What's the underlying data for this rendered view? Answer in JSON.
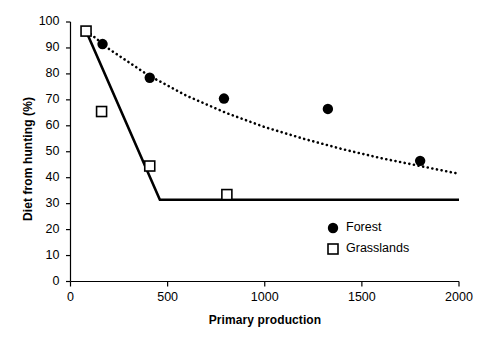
{
  "chart_data": {
    "type": "scatter",
    "title": "",
    "xlabel": "Primary production",
    "ylabel": "Diet from hunting (%)",
    "xlim": [
      0,
      2000
    ],
    "ylim": [
      0,
      100
    ],
    "xticks": [
      0,
      500,
      1000,
      1500,
      2000
    ],
    "yticks": [
      0,
      10,
      20,
      30,
      40,
      50,
      60,
      70,
      80,
      90,
      100
    ],
    "grid": false,
    "legend_position": "center-right",
    "series": [
      {
        "name": "Forest",
        "marker": "filled-circle",
        "color": "#000000",
        "points": [
          {
            "x": 165,
            "y": 91.5
          },
          {
            "x": 408,
            "y": 78.5
          },
          {
            "x": 790,
            "y": 70.5
          },
          {
            "x": 1325,
            "y": 66.5
          },
          {
            "x": 1800,
            "y": 46.5
          }
        ],
        "fit_line": {
          "style": "dotted",
          "points": [
            {
              "x": 85,
              "y": 96.5
            },
            {
              "x": 200,
              "y": 89.5
            },
            {
              "x": 400,
              "y": 79.5
            },
            {
              "x": 600,
              "y": 71.5
            },
            {
              "x": 800,
              "y": 65.0
            },
            {
              "x": 1000,
              "y": 59.5
            },
            {
              "x": 1200,
              "y": 55.0
            },
            {
              "x": 1400,
              "y": 51.0
            },
            {
              "x": 1600,
              "y": 47.5
            },
            {
              "x": 1800,
              "y": 44.5
            },
            {
              "x": 2000,
              "y": 41.5
            }
          ]
        }
      },
      {
        "name": "Grasslands",
        "marker": "open-square",
        "color": "#000000",
        "points": [
          {
            "x": 80,
            "y": 96.5
          },
          {
            "x": 160,
            "y": 65.5
          },
          {
            "x": 408,
            "y": 44.5
          },
          {
            "x": 805,
            "y": 33.5
          }
        ],
        "fit_line": {
          "style": "solid",
          "points": [
            {
              "x": 80,
              "y": 96.5
            },
            {
              "x": 460,
              "y": 31.5
            },
            {
              "x": 2000,
              "y": 31.5
            }
          ]
        }
      }
    ]
  },
  "axes": {
    "y_tick_labels": [
      "0",
      "10",
      "20",
      "30",
      "40",
      "50",
      "60",
      "70",
      "80",
      "90",
      "100"
    ],
    "x_tick_labels": [
      "0",
      "500",
      "1000",
      "1500",
      "2000"
    ],
    "y_title": "Diet from hunting (%)",
    "x_title": "Primary production"
  },
  "legend": {
    "entries": [
      {
        "label": "Forest",
        "marker": "filled-circle"
      },
      {
        "label": "Grasslands",
        "marker": "open-square"
      }
    ]
  }
}
